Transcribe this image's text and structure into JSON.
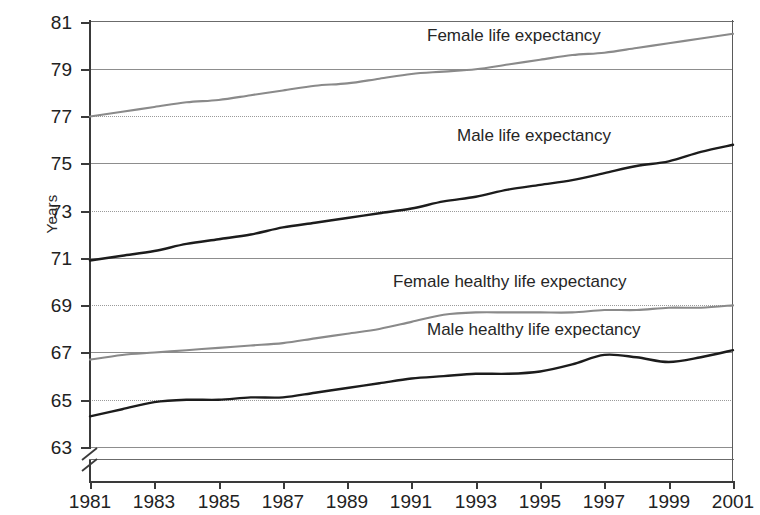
{
  "chart_data": {
    "type": "line",
    "title": "",
    "xlabel": "",
    "ylabel": "Years",
    "xlim": [
      1981,
      2001
    ],
    "ylim": [
      63,
      81
    ],
    "y_axis_break": true,
    "grid": true,
    "legend_position": "inline-labels",
    "x_tick_labels": [
      "1981",
      "1983",
      "1985",
      "1987",
      "1989",
      "1991",
      "1993",
      "1995",
      "1997",
      "1999",
      "2001"
    ],
    "y_tick_labels": [
      "63",
      "65",
      "67",
      "69",
      "71",
      "73",
      "75",
      "77",
      "79",
      "81"
    ],
    "x": [
      1981,
      1982,
      1983,
      1984,
      1985,
      1986,
      1987,
      1988,
      1989,
      1990,
      1991,
      1992,
      1993,
      1994,
      1995,
      1996,
      1997,
      1998,
      1999,
      2000,
      2001
    ],
    "series": [
      {
        "name": "Female life expectancy",
        "color": "#8a8a8a",
        "values": [
          77.0,
          77.2,
          77.4,
          77.6,
          77.7,
          77.9,
          78.1,
          78.3,
          78.4,
          78.6,
          78.8,
          78.9,
          79.0,
          79.2,
          79.4,
          79.6,
          79.7,
          79.9,
          80.1,
          80.3,
          80.5
        ]
      },
      {
        "name": "Male life expectancy",
        "color": "#1c1c1c",
        "values": [
          70.9,
          71.1,
          71.3,
          71.6,
          71.8,
          72.0,
          72.3,
          72.5,
          72.7,
          72.9,
          73.1,
          73.4,
          73.6,
          73.9,
          74.1,
          74.3,
          74.6,
          74.9,
          75.1,
          75.5,
          75.8
        ]
      },
      {
        "name": "Female healthy life expectancy",
        "color": "#8a8a8a",
        "values": [
          66.7,
          66.9,
          67.0,
          67.1,
          67.2,
          67.3,
          67.4,
          67.6,
          67.8,
          68.0,
          68.3,
          68.6,
          68.7,
          68.7,
          68.7,
          68.7,
          68.8,
          68.8,
          68.9,
          68.9,
          69.0
        ]
      },
      {
        "name": "Male healthy life expectancy",
        "color": "#1c1c1c",
        "values": [
          64.3,
          64.6,
          64.9,
          65.0,
          65.0,
          65.1,
          65.1,
          65.3,
          65.5,
          65.7,
          65.9,
          66.0,
          66.1,
          66.1,
          66.2,
          66.5,
          66.9,
          66.8,
          66.6,
          66.8,
          67.1
        ]
      }
    ],
    "series_label_positions": [
      {
        "name": "Female life expectancy",
        "left": 424,
        "top": 26
      },
      {
        "name": "Male life expectancy",
        "left": 454,
        "top": 126
      },
      {
        "name": "Female healthy life expectancy",
        "left": 390,
        "top": 272
      },
      {
        "name": "Male healthy life expectancy",
        "left": 424,
        "top": 320
      }
    ]
  },
  "axis": {
    "y_title": "Years",
    "y_ticks": [
      {
        "label": "81",
        "value": 81,
        "y": 22
      },
      {
        "label": "79",
        "value": 79,
        "y": 69
      },
      {
        "label": "77",
        "value": 77,
        "y": 116
      },
      {
        "label": "75",
        "value": 75,
        "y": 163
      },
      {
        "label": "73",
        "value": 73,
        "y": 211
      },
      {
        "label": "71",
        "value": 71,
        "y": 258
      },
      {
        "label": "69",
        "value": 69,
        "y": 305
      },
      {
        "label": "67",
        "value": 67,
        "y": 352
      },
      {
        "label": "65",
        "value": 65,
        "y": 400
      },
      {
        "label": "63",
        "value": 63,
        "y": 447
      }
    ],
    "x_ticks": [
      {
        "label": "1981",
        "value": 1981,
        "x": 90
      },
      {
        "label": "1983",
        "value": 1983,
        "x": 154
      },
      {
        "label": "1985",
        "value": 1985,
        "x": 219
      },
      {
        "label": "1987",
        "value": 1987,
        "x": 283
      },
      {
        "label": "1989",
        "value": 1989,
        "x": 347
      },
      {
        "label": "1991",
        "value": 1991,
        "x": 411
      },
      {
        "label": "1993",
        "value": 1993,
        "x": 476
      },
      {
        "label": "1995",
        "value": 1995,
        "x": 540
      },
      {
        "label": "1997",
        "value": 1997,
        "x": 604
      },
      {
        "label": "1999",
        "value": 1999,
        "x": 669
      },
      {
        "label": "2001",
        "value": 2001,
        "x": 733
      }
    ]
  }
}
